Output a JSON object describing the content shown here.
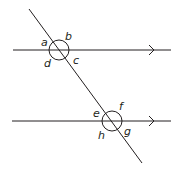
{
  "diagram": {
    "title": "",
    "lines": [
      {
        "id": "parallel-top",
        "x1": 13,
        "y1": 50,
        "x2": 171,
        "y2": 50,
        "arrow_x": 153
      },
      {
        "id": "parallel-bottom",
        "x1": 12,
        "y1": 121,
        "x2": 171,
        "y2": 121,
        "arrow_x": 153
      },
      {
        "id": "transversal",
        "x1": 29,
        "y1": 9,
        "x2": 142,
        "y2": 163
      }
    ],
    "intersections": [
      {
        "id": "top",
        "cx": 59,
        "cy": 50,
        "r": 10
      },
      {
        "id": "bottom",
        "cx": 112,
        "cy": 121,
        "r": 10
      }
    ],
    "angle_labels": {
      "a": "a",
      "b": "b",
      "c": "c",
      "d": "d",
      "e": "e",
      "f": "f",
      "g": "g",
      "h": "h"
    },
    "colors": {
      "stroke": "#231f20",
      "background": "#ffffff"
    }
  }
}
